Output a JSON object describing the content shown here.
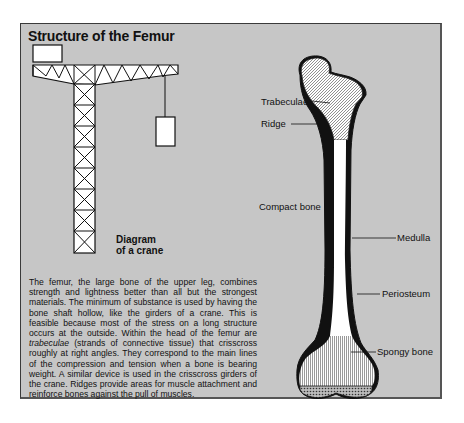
{
  "title": "Structure of the Femur",
  "crane_caption": {
    "line1": "Diagram",
    "line2": "of a crane"
  },
  "bone_labels": {
    "trabeculae": "Trabeculae",
    "ridge": "Ridge",
    "compact_bone": "Compact bone",
    "medulla": "Medulla",
    "periosteum": "Periosteum",
    "spongy_bone": "Spongy bone"
  },
  "body_text": {
    "part1": "The femur, the large bone of the upper leg, combines strength and lightness better than all but the strongest materials. The minimum of substance is used by having the bone shaft hollow, like the girders of a crane. This is feasible because most of the stress on a long structure occurs at the outside. Within the head of the femur are ",
    "italic": "trabeculae",
    "part2": " (strands of connective tissue) that crisscross roughly at right angles. They correspond to the main lines of the compression and tension when a bone is bearing weight. A similar device is used in the crisscross girders of the crane. Ridges provide areas for muscle attachment and reinforce bones against the pull of muscles."
  },
  "colors": {
    "panel_bg": "#c6c6c6",
    "ink": "#111111",
    "bone_fill": "#ffffff"
  }
}
